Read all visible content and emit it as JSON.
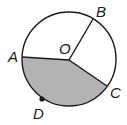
{
  "diagram": {
    "type": "circle-sector",
    "colors": {
      "stroke": "#1a1a1a",
      "shaded_fill": "#b3b3b3",
      "background": "#ffffff"
    },
    "circle": {
      "center_label": "O",
      "cx": 69,
      "cy": 59,
      "r": 47
    },
    "points": [
      {
        "label": "A",
        "x": 22,
        "y": 57
      },
      {
        "label": "B",
        "x": 92,
        "y": 20
      },
      {
        "label": "C",
        "x": 107,
        "y": 86
      },
      {
        "label": "D",
        "x": 42,
        "y": 99
      },
      {
        "label": "O",
        "x": 69,
        "y": 60
      }
    ],
    "segments": [
      "OA",
      "OB",
      "OC"
    ],
    "shaded_region": "sector AOC containing arc ADC"
  }
}
